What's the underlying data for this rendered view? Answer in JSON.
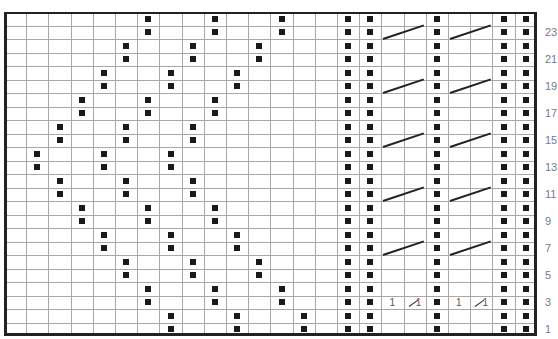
{
  "chart": {
    "columns": 24,
    "rows": 24,
    "origin": {
      "x": 4,
      "y": 12
    },
    "cell_width": 22.2,
    "cell_height": 13.5,
    "symbol_color": "#1a1a1a",
    "grid_color": "#a8a8a8",
    "legend": {
      "dot": "purl stitch",
      "cable_line": "cable crossing over 2 stitches",
      "one_slash_one": "1/1 cross"
    }
  },
  "row_labels": [
    "1",
    "3",
    "5",
    "7",
    "9",
    "11",
    "13",
    "15",
    "17",
    "19",
    "21",
    "23"
  ],
  "dots": [
    {
      "row": 24,
      "cols": [
        7,
        10,
        13,
        16,
        17,
        20,
        23,
        24
      ]
    },
    {
      "row": 23,
      "cols": [
        7,
        10,
        13,
        16,
        17,
        20,
        23,
        24
      ]
    },
    {
      "row": 22,
      "cols": [
        6,
        9,
        12,
        16,
        17,
        20,
        23,
        24
      ]
    },
    {
      "row": 21,
      "cols": [
        6,
        9,
        12,
        16,
        17,
        20,
        23,
        24
      ]
    },
    {
      "row": 20,
      "cols": [
        5,
        8,
        11,
        16,
        17,
        20,
        23,
        24
      ]
    },
    {
      "row": 19,
      "cols": [
        5,
        8,
        11,
        16,
        17,
        20,
        23,
        24
      ]
    },
    {
      "row": 18,
      "cols": [
        4,
        7,
        10,
        16,
        17,
        20,
        23,
        24
      ]
    },
    {
      "row": 17,
      "cols": [
        4,
        7,
        10,
        16,
        17,
        20,
        23,
        24
      ]
    },
    {
      "row": 16,
      "cols": [
        3,
        6,
        9,
        16,
        17,
        20,
        23,
        24
      ]
    },
    {
      "row": 15,
      "cols": [
        3,
        6,
        9,
        16,
        17,
        20,
        23,
        24
      ]
    },
    {
      "row": 14,
      "cols": [
        2,
        5,
        8,
        16,
        17,
        20,
        23,
        24
      ]
    },
    {
      "row": 13,
      "cols": [
        2,
        5,
        8,
        16,
        17,
        20,
        23,
        24
      ]
    },
    {
      "row": 12,
      "cols": [
        3,
        6,
        9,
        16,
        17,
        20,
        23,
        24
      ]
    },
    {
      "row": 11,
      "cols": [
        3,
        6,
        9,
        16,
        17,
        20,
        23,
        24
      ]
    },
    {
      "row": 10,
      "cols": [
        4,
        7,
        10,
        16,
        17,
        20,
        23,
        24
      ]
    },
    {
      "row": 9,
      "cols": [
        4,
        7,
        10,
        16,
        17,
        20,
        23,
        24
      ]
    },
    {
      "row": 8,
      "cols": [
        5,
        8,
        11,
        16,
        17,
        20,
        23,
        24
      ]
    },
    {
      "row": 7,
      "cols": [
        5,
        8,
        11,
        16,
        17,
        20,
        23,
        24
      ]
    },
    {
      "row": 6,
      "cols": [
        6,
        9,
        12,
        16,
        17,
        20,
        23,
        24
      ]
    },
    {
      "row": 5,
      "cols": [
        6,
        9,
        12,
        16,
        17,
        20,
        23,
        24
      ]
    },
    {
      "row": 4,
      "cols": [
        7,
        10,
        13,
        16,
        17,
        20,
        23,
        24
      ]
    },
    {
      "row": 3,
      "cols": [
        7,
        10,
        13,
        16,
        17,
        20,
        23,
        24
      ]
    },
    {
      "row": 2,
      "cols": [
        8,
        11,
        14,
        16,
        17,
        20,
        23,
        24
      ]
    },
    {
      "row": 1,
      "cols": [
        8,
        11,
        14,
        16,
        17,
        20,
        23,
        24
      ]
    }
  ],
  "cables": [
    {
      "row": 23,
      "from_col": 18,
      "to_col": 19
    },
    {
      "row": 23,
      "from_col": 21,
      "to_col": 22
    },
    {
      "row": 19,
      "from_col": 18,
      "to_col": 19
    },
    {
      "row": 19,
      "from_col": 21,
      "to_col": 22
    },
    {
      "row": 15,
      "from_col": 18,
      "to_col": 19
    },
    {
      "row": 15,
      "from_col": 21,
      "to_col": 22
    },
    {
      "row": 11,
      "from_col": 18,
      "to_col": 19
    },
    {
      "row": 11,
      "from_col": 21,
      "to_col": 22
    },
    {
      "row": 7,
      "from_col": 18,
      "to_col": 19
    },
    {
      "row": 7,
      "from_col": 21,
      "to_col": 22
    }
  ],
  "cross_marks": [
    {
      "row": 3,
      "left_col": 18,
      "right_col": 19,
      "left_text": "1",
      "right_text": "1"
    },
    {
      "row": 3,
      "left_col": 21,
      "right_col": 22,
      "left_text": "1",
      "right_text": "1"
    }
  ]
}
